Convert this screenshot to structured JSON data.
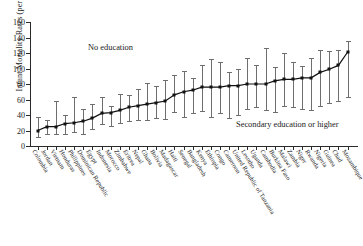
{
  "chart_data": {
    "type": "line",
    "title": "",
    "xlabel": "",
    "ylabel": "Infant Mortality Rates (per 1,000 live births)",
    "ylim": [
      0,
      160
    ],
    "yticks": [
      0,
      20,
      40,
      60,
      80,
      100,
      120,
      140,
      160
    ],
    "grid": false,
    "legend_position": "inline-annotations",
    "annotations": [
      {
        "text": "No education",
        "x_index": 9,
        "y": 125
      },
      {
        "text": "Secondary education or higher",
        "x_index": 24,
        "y": 30
      }
    ],
    "categories": [
      "Colombia",
      "Jordan",
      "Vietnam",
      "Honduras",
      "Philippines",
      "Dominican Republic",
      "Egypt",
      "Indonesia",
      "Morocco",
      "Zimbabwe",
      "Eritrea",
      "Nepal",
      "Ghana",
      "Bolivia",
      "Madagascar",
      "Haiti",
      "Senegal",
      "Bangladesh",
      "Kenya",
      "Ethiopia",
      "Congo",
      "Cameroon",
      "United Republic of Tanzania",
      "Lesotho",
      "Uganda",
      "Cambodia",
      "Burkina Faso",
      "Malawi",
      "Zambia",
      "Niger",
      "Rwanda",
      "Nigeria",
      "Guinea",
      "Chad",
      "Mozambique"
    ],
    "series": [
      {
        "name": "Overall infant mortality rate",
        "values": [
          20,
          25,
          25,
          29,
          30,
          32,
          36,
          42,
          43,
          46,
          50,
          52,
          54,
          56,
          58,
          66,
          70,
          72,
          76,
          76,
          76,
          78,
          78,
          80,
          80,
          80,
          84,
          86,
          86,
          88,
          88,
          95,
          99,
          104,
          121
        ]
      },
      {
        "name": "Secondary education or higher (lower bound)",
        "values": [
          11,
          16,
          15,
          16,
          18,
          16,
          22,
          28,
          26,
          30,
          32,
          34,
          33,
          36,
          35,
          44,
          38,
          43,
          45,
          38,
          42,
          36,
          40,
          48,
          50,
          46,
          44,
          52,
          50,
          48,
          46,
          52,
          56,
          58,
          63
        ]
      },
      {
        "name": "No education (upper bound)",
        "values": [
          38,
          33,
          58,
          40,
          63,
          48,
          54,
          63,
          52,
          67,
          66,
          73,
          81,
          77,
          85,
          92,
          97,
          88,
          104,
          112,
          108,
          96,
          100,
          113,
          105,
          126,
          102,
          120,
          108,
          103,
          113,
          124,
          122,
          124,
          136
        ]
      }
    ]
  }
}
